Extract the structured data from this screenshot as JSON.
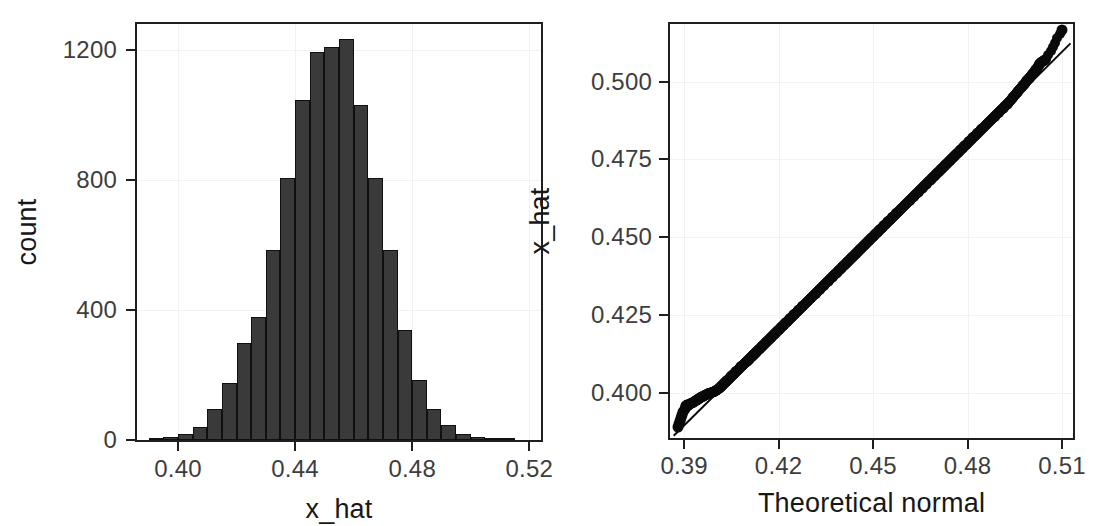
{
  "figure": {
    "panels": [
      "histogram-panel",
      "qq-panel"
    ]
  },
  "chart_data": [
    {
      "type": "bar",
      "name": "histogram-of-x_hat",
      "title": "",
      "xlabel": "x_hat",
      "ylabel": "count",
      "xlim": [
        0.386,
        0.524
      ],
      "ylim": [
        0,
        1280
      ],
      "xticks": [
        "0.40",
        "0.44",
        "0.48",
        "0.52"
      ],
      "xtick_values": [
        0.4,
        0.44,
        0.48,
        0.52
      ],
      "yticks": [
        "0",
        "400",
        "800",
        "1200"
      ],
      "ytick_values": [
        0,
        400,
        800,
        1200
      ],
      "grid": true,
      "legend": "none",
      "bin_width": 0.005,
      "bin_left_edges": [
        0.39,
        0.395,
        0.4,
        0.405,
        0.41,
        0.415,
        0.42,
        0.425,
        0.43,
        0.435,
        0.44,
        0.445,
        0.45,
        0.455,
        0.46,
        0.465,
        0.47,
        0.475,
        0.48,
        0.485,
        0.49,
        0.495,
        0.5,
        0.505,
        0.51
      ],
      "categories": [
        "0.390",
        "0.395",
        "0.400",
        "0.405",
        "0.410",
        "0.415",
        "0.420",
        "0.425",
        "0.430",
        "0.435",
        "0.440",
        "0.445",
        "0.450",
        "0.455",
        "0.460",
        "0.465",
        "0.470",
        "0.475",
        "0.480",
        "0.485",
        "0.490",
        "0.495",
        "0.500",
        "0.505",
        "0.510"
      ],
      "values": [
        4,
        8,
        18,
        40,
        95,
        175,
        300,
        380,
        585,
        805,
        1045,
        1195,
        1210,
        1235,
        1030,
        805,
        585,
        340,
        185,
        95,
        45,
        18,
        8,
        4,
        2
      ]
    },
    {
      "type": "scatter",
      "name": "normal-qq-plot-of-x_hat",
      "title": "",
      "xlabel": "Theoretical normal",
      "ylabel": "x_hat",
      "xlim": [
        0.3855,
        0.5135
      ],
      "ylim": [
        0.3855,
        0.5185
      ],
      "xticks": [
        "0.39",
        "0.42",
        "0.45",
        "0.48",
        "0.51"
      ],
      "xtick_values": [
        0.39,
        0.42,
        0.45,
        0.48,
        0.51
      ],
      "yticks": [
        "0.400",
        "0.425",
        "0.450",
        "0.475",
        "0.500"
      ],
      "ytick_values": [
        0.4,
        0.425,
        0.45,
        0.475,
        0.5
      ],
      "grid": true,
      "legend": "none",
      "reference_line": {
        "x0": 0.3865,
        "y0": 0.3865,
        "x1": 0.5125,
        "y1": 0.5125,
        "slope": 1.0,
        "intercept": 0.0
      },
      "notes": "points lie essentially on the 1:1 reference line; a single high outlier sits above the line near x=0.510",
      "points_x": [
        0.388,
        0.3905,
        0.3915,
        0.3922,
        0.393,
        0.3936,
        0.3942,
        0.3948,
        0.3954,
        0.396,
        0.3966,
        0.3972,
        0.3978,
        0.3984,
        0.399,
        0.3996,
        0.4002,
        0.401,
        0.4018,
        0.4026,
        0.4034,
        0.4042,
        0.405,
        0.4058,
        0.4066,
        0.4074,
        0.4082,
        0.409,
        0.4098,
        0.4106,
        0.4114,
        0.4122,
        0.413,
        0.414,
        0.415,
        0.416,
        0.417,
        0.418,
        0.419,
        0.42,
        0.421,
        0.422,
        0.423,
        0.424,
        0.425,
        0.426,
        0.427,
        0.428,
        0.429,
        0.43,
        0.431,
        0.432,
        0.433,
        0.434,
        0.435,
        0.436,
        0.437,
        0.438,
        0.439,
        0.44,
        0.441,
        0.442,
        0.443,
        0.444,
        0.445,
        0.446,
        0.447,
        0.448,
        0.449,
        0.45,
        0.451,
        0.452,
        0.453,
        0.454,
        0.455,
        0.456,
        0.457,
        0.458,
        0.459,
        0.46,
        0.461,
        0.462,
        0.463,
        0.464,
        0.465,
        0.466,
        0.467,
        0.468,
        0.469,
        0.47,
        0.471,
        0.472,
        0.473,
        0.474,
        0.475,
        0.476,
        0.477,
        0.478,
        0.479,
        0.48,
        0.481,
        0.482,
        0.483,
        0.484,
        0.485,
        0.486,
        0.487,
        0.488,
        0.489,
        0.49,
        0.491,
        0.492,
        0.493,
        0.494,
        0.495,
        0.496,
        0.497,
        0.498,
        0.499,
        0.5,
        0.501,
        0.502,
        0.503,
        0.504,
        0.505,
        0.51
      ],
      "points_y": [
        0.389,
        0.3958,
        0.3962,
        0.3966,
        0.397,
        0.3974,
        0.3978,
        0.3982,
        0.3986,
        0.3989,
        0.3992,
        0.3995,
        0.3998,
        0.4,
        0.4002,
        0.4004,
        0.4008,
        0.4014,
        0.4021,
        0.4029,
        0.4037,
        0.4045,
        0.4053,
        0.4061,
        0.4069,
        0.4077,
        0.4085,
        0.4093,
        0.41,
        0.4108,
        0.4116,
        0.4124,
        0.4132,
        0.4142,
        0.4152,
        0.4162,
        0.4172,
        0.4182,
        0.4192,
        0.4202,
        0.4212,
        0.4222,
        0.4232,
        0.4242,
        0.4252,
        0.4262,
        0.4272,
        0.4282,
        0.4292,
        0.4302,
        0.4312,
        0.4322,
        0.4332,
        0.4342,
        0.4352,
        0.4362,
        0.4372,
        0.4382,
        0.4392,
        0.4402,
        0.4412,
        0.4422,
        0.4432,
        0.4442,
        0.4452,
        0.4462,
        0.4472,
        0.4482,
        0.4492,
        0.4502,
        0.4512,
        0.4522,
        0.4532,
        0.4542,
        0.4552,
        0.4562,
        0.4572,
        0.4582,
        0.4592,
        0.4602,
        0.4612,
        0.4622,
        0.4632,
        0.4642,
        0.4652,
        0.4662,
        0.4672,
        0.4682,
        0.4692,
        0.4702,
        0.4712,
        0.4722,
        0.4732,
        0.4742,
        0.4752,
        0.4762,
        0.4772,
        0.4782,
        0.4792,
        0.4802,
        0.4812,
        0.4822,
        0.4832,
        0.4842,
        0.4852,
        0.4862,
        0.4872,
        0.4882,
        0.4892,
        0.4902,
        0.4912,
        0.4922,
        0.4932,
        0.4944,
        0.4956,
        0.4968,
        0.498,
        0.4992,
        0.5004,
        0.5016,
        0.5028,
        0.5042,
        0.5058,
        0.5066,
        0.5072,
        0.5165
      ]
    }
  ],
  "colors": {
    "bar_fill": "#3a3a3a",
    "bar_stroke": "#101010",
    "point": "#0a0a0a",
    "axis": "#1f1f1f",
    "grid": "#f2f2f2",
    "tick_label": "#3d3d3d",
    "axis_title": "#171717",
    "background": "#ffffff"
  }
}
